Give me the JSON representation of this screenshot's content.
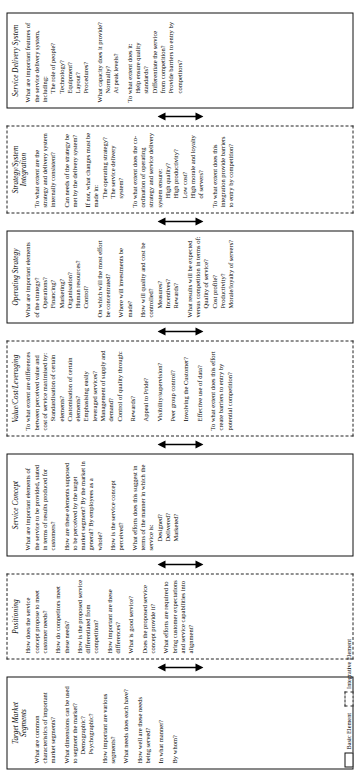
{
  "diagram": {
    "orientation": "rotated-90-ccw",
    "colors": {
      "basic_border": "#111111",
      "integrative_border": "#222222",
      "background": "#ffffff",
      "text": "#000000"
    },
    "legend": {
      "basic_label": "Basic Element",
      "integrative_label": "Integrative Element"
    },
    "boxes": [
      {
        "id": "target-market-segments",
        "kind": "basic",
        "title": "Target Market\nSegments",
        "questions": [
          {
            "lead": "What are common characteristics of important market segments?"
          },
          {
            "lead": "What dimensions can be used to segment the market?",
            "subs": [
              "Demographic?",
              "Psychographic?"
            ]
          },
          {
            "lead": "How important are various segments?"
          },
          {
            "lead": "What needs does each have?"
          },
          {
            "lead": "How well are these needs being served?"
          },
          {
            "lead": "In what manner?"
          },
          {
            "lead": "By whom?"
          }
        ]
      },
      {
        "id": "positioning",
        "kind": "integrative",
        "title": "Positioning",
        "questions": [
          {
            "lead": "How does the service concept propose to meet customer needs?"
          },
          {
            "lead": "How do competitors meet these needs?"
          },
          {
            "lead": "How is the proposed service differentiated from competition?"
          },
          {
            "lead": "How important are these differences?"
          },
          {
            "lead": "What is good service?"
          },
          {
            "lead": "Does the proposed service concept provide it?"
          },
          {
            "lead": "What efforts are required to bring customer expectations and service capabilities into alignment?"
          }
        ]
      },
      {
        "id": "service-concept",
        "kind": "basic",
        "title": "Service Concept",
        "questions": [
          {
            "lead": "What are important elements of the service to be provided, stated in terms of results produced for customers?"
          },
          {
            "lead": "How are these elements supposed to be perceived by the target market segment? By the market in general? By employees as a whole?"
          },
          {
            "lead": "How is the service concept perceived?"
          },
          {
            "lead": "What efforts does this suggest in terms of the manner in which the service is:",
            "subs": [
              "Designed?",
              "Delivered?",
              "Marketed?"
            ]
          }
        ]
      },
      {
        "id": "value-cost-leveraging",
        "kind": "integrative",
        "title": "Value/Cost/Leveraging",
        "questions": [
          {
            "lead": "To what extent are differences between perceived value and cost of service maximised by:",
            "subs": [
              "Standardisation of certain elements?",
              "Customisation of certain elements?",
              "Emphasising easily leveraged services?",
              "Management of supply and demand?",
              "Control of quality through:"
            ]
          },
          {
            "lead": "Rewards?",
            "indent": true
          },
          {
            "lead": "Appeal to Pride?",
            "indent": true
          },
          {
            "lead": "Visibility/supervision?",
            "indent": true
          },
          {
            "lead": "Peer group control?",
            "indent": true
          },
          {
            "lead": "Involving the Customer?",
            "indent": true
          },
          {
            "lead": "Effective use of data?",
            "indent": true
          },
          {
            "lead": "To what extent does this effort create barriers to entry by potential competition?"
          }
        ]
      },
      {
        "id": "operating-strategy",
        "kind": "basic",
        "title": "Operating Strategy",
        "questions": [
          {
            "lead": "What are important elements of the strategy?",
            "subs": [
              "Operations?",
              "Financing?",
              "Marketing?",
              "Organisation?",
              "Human resources?",
              "Control?"
            ]
          },
          {
            "lead": "On which will the most effort be concentrated?"
          },
          {
            "lead": "Where will investments be made?"
          },
          {
            "lead": "How will quality and cost be controlled?",
            "subs": [
              "Measures?",
              "Incentives?",
              "Rewards?"
            ]
          },
          {
            "lead": "What results will be expected versus competition in terms of:",
            "subs": [
              "Quality of service?",
              "Cost profile?",
              "Productivity?",
              "Morale/loyalty of servers?"
            ]
          }
        ]
      },
      {
        "id": "strategy-system-integration",
        "kind": "integrative",
        "title": "Strategy/System\nIntegration",
        "questions": [
          {
            "lead": "To what extent are the strategy and delivery system internally consistent?"
          },
          {
            "lead": "Can needs of the strategy be met by the delivery system?"
          },
          {
            "lead": "If not, what changes must be made in:",
            "subs": [
              "The operating strategy?",
              "The service delivery system?"
            ]
          },
          {
            "lead": "To what extent does the co-ordination of operating strategy and service delivery system ensure:",
            "subs": [
              "High quality?",
              "High productivity?",
              "Low cost?",
              "High morale and loyalty of servers?"
            ]
          },
          {
            "lead": "To what extent does this integration provide barriers to entry by competition?"
          }
        ]
      },
      {
        "id": "service-delivery-system",
        "kind": "basic",
        "title": "Service Delivery System",
        "questions": [
          {
            "lead": "What are important features of the service delivery system, including:",
            "subs": [
              "The role of people?",
              "Technology?",
              "Equipment?",
              "Layout?",
              "Procedures?"
            ]
          },
          {
            "lead": "What capacity does it provide?",
            "subs": [
              "Normally?",
              "At peak levels?"
            ]
          },
          {
            "lead": "To what extent does it:",
            "subs": [
              "Help ensure quality standards?",
              "Differentiate the service from competition?",
              "Provide barriers to entry by competitors?"
            ]
          }
        ]
      }
    ],
    "connectors": [
      {
        "id": "conn-target-positioning",
        "type": "double-arrow-vertical"
      },
      {
        "id": "conn-positioning-concept",
        "type": "double-arrow-vertical"
      },
      {
        "id": "conn-concept-value",
        "type": "double-arrow-vertical"
      },
      {
        "id": "conn-value-opstrat",
        "type": "double-arrow-vertical"
      },
      {
        "id": "conn-opstrat-integration",
        "type": "double-arrow-vertical"
      },
      {
        "id": "conn-integration-delivery",
        "type": "double-arrow-vertical"
      }
    ]
  }
}
